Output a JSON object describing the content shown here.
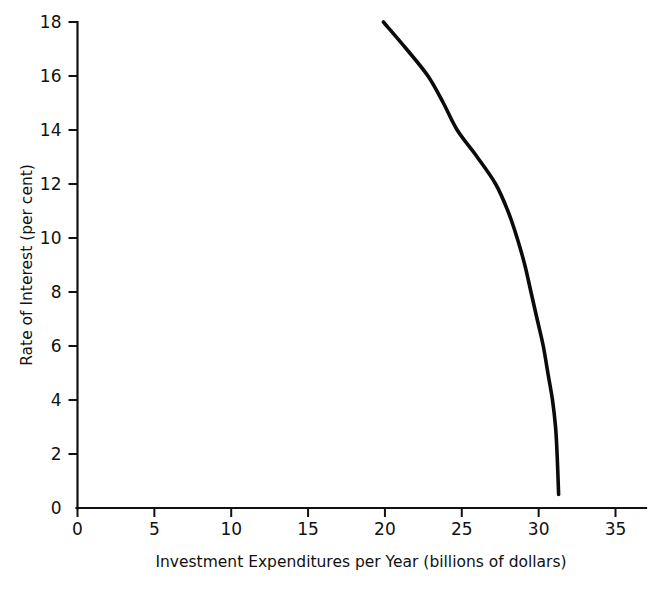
{
  "chart_data": {
    "type": "line",
    "title": "",
    "xlabel": "Investment Expenditures per Year (billions of dollars)",
    "ylabel": "Rate of Interest (per cent)",
    "xlim": [
      0,
      37.5
    ],
    "ylim": [
      0,
      18
    ],
    "grid": false,
    "legend": null,
    "xticks": [
      0,
      5,
      10,
      15,
      20,
      25,
      30,
      35
    ],
    "xtick_labels": [
      "0",
      "5",
      "10",
      "15",
      "20",
      "25",
      "30",
      "35"
    ],
    "yticks": [
      0,
      2,
      4,
      6,
      8,
      10,
      12,
      14,
      16,
      18
    ],
    "ytick_labels": [
      "0",
      "2",
      "4",
      "6",
      "8",
      "10",
      "12",
      "14",
      "16",
      "18"
    ],
    "series": [
      {
        "name": "Marginal efficiency of investment schedule",
        "color": "#0b0b0b",
        "x": [
          19.9,
          21.4,
          22.8,
          23.8,
          24.7,
          26.0,
          27.2,
          28.0,
          28.6,
          29.1,
          29.5,
          29.9,
          30.3,
          30.6,
          30.9,
          31.1,
          31.2,
          31.3
        ],
        "y": [
          18.0,
          17.0,
          16.0,
          15.0,
          14.0,
          13.0,
          12.0,
          11.0,
          10.0,
          9.0,
          8.0,
          7.0,
          6.0,
          5.0,
          4.0,
          3.0,
          2.0,
          0.5
        ]
      }
    ],
    "caption": ""
  },
  "axis_titles": {
    "x": "Investment Expenditures per Year (billions of dollars)",
    "y": "Rate of Interest (per cent)"
  }
}
